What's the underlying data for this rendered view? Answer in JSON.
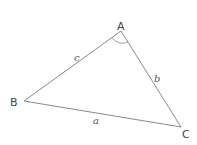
{
  "diagram": {
    "type": "triangle",
    "vertices": [
      {
        "name": "A",
        "x": 121,
        "y": 31
      },
      {
        "name": "B",
        "x": 24,
        "y": 101
      },
      {
        "name": "C",
        "x": 181,
        "y": 127
      }
    ],
    "vertex_labels": {
      "A": "A",
      "B": "B",
      "C": "C"
    },
    "side_labels": {
      "a": "a",
      "b": "b",
      "c": "c"
    },
    "angle_marked": "A",
    "stroke_color": "#888888"
  }
}
